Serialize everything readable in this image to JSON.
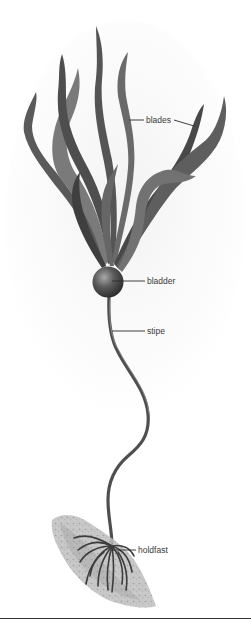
{
  "figure": {
    "labels": {
      "blades": "blades",
      "bladder": "bladder",
      "stipe": "stipe",
      "holdfast": "holdfast"
    }
  },
  "colors": {
    "background": "#ffffff",
    "blade_dark": "#4a4a4a",
    "blade_mid": "#6e6e6e",
    "blade_light": "#8c8c8c",
    "stipe": "#555555",
    "bladder_highlight": "#9a9a9a",
    "bladder_shadow": "#2e2e2e",
    "rock": "#b5b5b5",
    "rule": "#333333"
  }
}
